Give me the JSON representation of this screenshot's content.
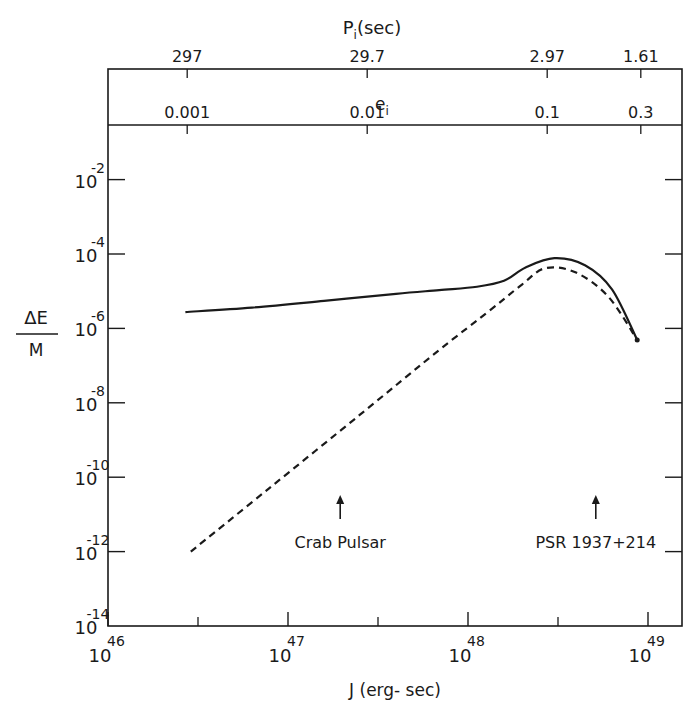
{
  "chart_data": {
    "type": "line",
    "title": "",
    "xlabel": "J (erg- sec)",
    "ylabel": "ΔE / M",
    "xscale": "log",
    "yscale": "log",
    "xlim_log10": [
      46,
      49.2
    ],
    "ylim_log10": [
      -14,
      -0.5
    ],
    "x_ticks": [
      {
        "base": "10",
        "exp": "46",
        "log": 46
      },
      {
        "base": "10",
        "exp": "47",
        "log": 47
      },
      {
        "base": "10",
        "exp": "48",
        "log": 48
      },
      {
        "base": "10",
        "exp": "49",
        "log": 49
      }
    ],
    "y_ticks": [
      {
        "base": "10",
        "exp": "-2",
        "log": -2
      },
      {
        "base": "10",
        "exp": "-4",
        "log": -4
      },
      {
        "base": "10",
        "exp": "-6",
        "log": -6
      },
      {
        "base": "10",
        "exp": "-8",
        "log": -8
      },
      {
        "base": "10",
        "exp": "-10",
        "log": -10
      },
      {
        "base": "10",
        "exp": "-12",
        "log": -12
      },
      {
        "base": "10",
        "exp": "-14",
        "log": -14
      }
    ],
    "top_axis_1": {
      "label": "P",
      "label_sub": "i",
      "label_suffix": "(sec)",
      "ticks": [
        {
          "text": "297",
          "x_log10J": 46.44
        },
        {
          "text": "29.7",
          "x_log10J": 47.44
        },
        {
          "text": "2.97",
          "x_log10J": 48.44
        },
        {
          "text": "1.61",
          "x_log10J": 48.96
        }
      ]
    },
    "top_axis_2": {
      "label": "e",
      "label_sub": "i",
      "ticks": [
        {
          "text": "0.001",
          "x_log10J": 46.44
        },
        {
          "text": "0.01",
          "x_log10J": 47.44
        },
        {
          "text": "0.1",
          "x_log10J": 48.44
        },
        {
          "text": "0.3",
          "x_log10J": 48.96
        }
      ]
    },
    "series": [
      {
        "name": "solid",
        "style": "solid",
        "points_log10": [
          [
            46.43,
            -5.56
          ],
          [
            46.8,
            -5.44
          ],
          [
            47.2,
            -5.26
          ],
          [
            47.6,
            -5.07
          ],
          [
            47.84,
            -4.97
          ],
          [
            48.05,
            -4.88
          ],
          [
            48.2,
            -4.72
          ],
          [
            48.32,
            -4.36
          ],
          [
            48.48,
            -4.11
          ],
          [
            48.65,
            -4.3
          ],
          [
            48.8,
            -4.95
          ],
          [
            48.94,
            -6.31
          ]
        ]
      },
      {
        "name": "dashed",
        "style": "dashed",
        "points_log10": [
          [
            46.46,
            -12.0
          ],
          [
            46.9,
            -10.28
          ],
          [
            47.4,
            -8.32
          ],
          [
            47.84,
            -6.58
          ],
          [
            48.1,
            -5.6
          ],
          [
            48.3,
            -4.82
          ],
          [
            48.43,
            -4.38
          ],
          [
            48.6,
            -4.5
          ],
          [
            48.78,
            -5.15
          ],
          [
            48.94,
            -6.31
          ]
        ]
      }
    ],
    "annotations": [
      {
        "text": "Crab Pulsar",
        "x_log10J": 47.29,
        "arrow": "up"
      },
      {
        "text": "PSR 1937+214",
        "x_log10J": 48.71,
        "arrow": "up"
      }
    ],
    "grid": false,
    "legend": null
  }
}
